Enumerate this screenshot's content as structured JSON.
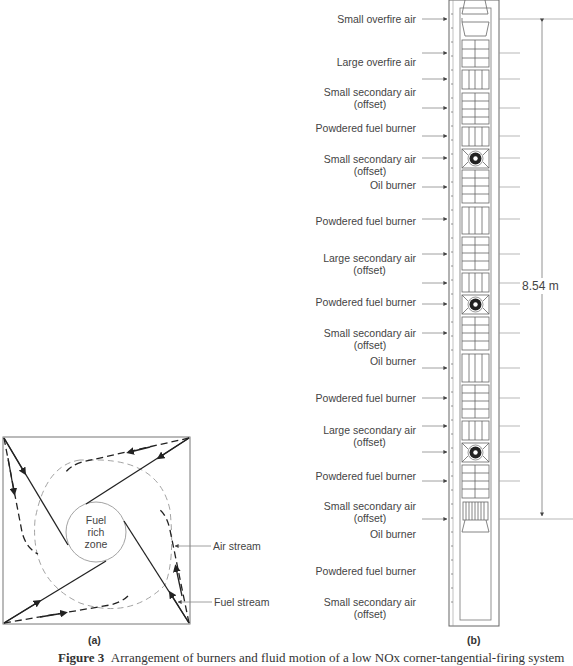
{
  "figure": {
    "panel_a": {
      "sublabel": "(a)",
      "center_label_lines": [
        "Fuel",
        "rich",
        "zone"
      ],
      "callouts": {
        "air_stream": "Air stream",
        "fuel_stream": "Fuel stream"
      }
    },
    "panel_b": {
      "sublabel": "(b)",
      "dimension": "8.54 m",
      "ports": [
        {
          "label": "Small overfire air",
          "label2": "",
          "type": "small-overfire-air"
        },
        {
          "label": "Large overfire air",
          "label2": "",
          "type": "large-overfire-air"
        },
        {
          "label": "Small secondary air",
          "label2": "(offset)",
          "type": "small-secondary-air"
        },
        {
          "label": "Powdered fuel burner",
          "label2": "",
          "type": "powdered-fuel-burner"
        },
        {
          "label": "Small secondary air",
          "label2": "(offset)",
          "type": "small-secondary-air"
        },
        {
          "label": "Oil burner",
          "label2": "",
          "type": "oil-burner"
        },
        {
          "label": "Powdered fuel burner",
          "label2": "",
          "type": "powdered-fuel-burner"
        },
        {
          "label": "Large secondary air",
          "label2": "(offset)",
          "type": "large-secondary-air"
        },
        {
          "label": "Powdered fuel burner",
          "label2": "",
          "type": "powdered-fuel-burner"
        },
        {
          "label": "Small secondary air",
          "label2": "(offset)",
          "type": "small-secondary-air"
        },
        {
          "label": "Oil burner",
          "label2": "",
          "type": "oil-burner"
        },
        {
          "label": "Powdered fuel burner",
          "label2": "",
          "type": "powdered-fuel-burner"
        },
        {
          "label": "Large secondary air",
          "label2": "(offset)",
          "type": "large-secondary-air"
        },
        {
          "label": "Powdered fuel burner",
          "label2": "",
          "type": "powdered-fuel-burner"
        },
        {
          "label": "Small secondary air",
          "label2": "(offset)",
          "type": "small-secondary-air"
        },
        {
          "label": "Oil burner",
          "label2": "",
          "type": "oil-burner"
        },
        {
          "label": "Powdered fuel burner",
          "label2": "",
          "type": "powdered-fuel-burner"
        },
        {
          "label": "Small secondary air",
          "label2": "(offset)",
          "type": "small-secondary-air"
        }
      ]
    },
    "caption": {
      "prefix": "Figure 3",
      "text": "Arrangement of burners and fluid motion of a low NOx corner-tangential-firing system"
    }
  }
}
